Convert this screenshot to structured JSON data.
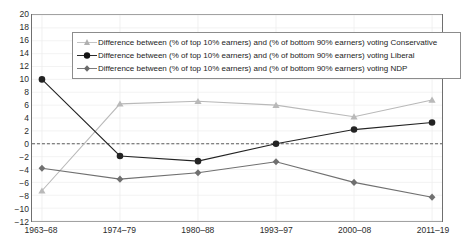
{
  "chart_data": {
    "type": "line",
    "title": "",
    "xlabel": "",
    "ylabel": "",
    "categories": [
      "1963–68",
      "1974–79",
      "1980–88",
      "1993–97",
      "2000–08",
      "2011–19"
    ],
    "ylim": [
      -12,
      20
    ],
    "ytick_step": 2,
    "yticks": [
      20,
      18,
      16,
      14,
      12,
      10,
      8,
      6,
      4,
      2,
      0,
      -2,
      -4,
      -6,
      -8,
      -10,
      -12
    ],
    "ytick_labels": [
      "20",
      "18",
      "16",
      "14",
      "12",
      "10",
      "8",
      "6",
      "4",
      "2",
      "0",
      "−2",
      "−4",
      "−6",
      "−8",
      "−10",
      "−12"
    ],
    "grid": "faint horizontal and vertical gridlines",
    "zero_line": "dashed gray reference line at y = 0",
    "legend_position": "top-inside",
    "series": [
      {
        "name": "Difference between (% of top 10% earners) and (% of bottom 90% earners) voting Conservative",
        "values": [
          -7.3,
          6.2,
          6.6,
          6.0,
          4.2,
          6.8
        ],
        "color": "#b9b9b9",
        "marker": "triangle"
      },
      {
        "name": "Difference between (% of top 10% earners) and (% of bottom 90% earners) voting Liberal",
        "values": [
          10.0,
          -1.9,
          -2.7,
          0.0,
          2.2,
          3.3
        ],
        "color": "#232323",
        "marker": "circle"
      },
      {
        "name": "Difference between (% of top 10% earners) and (% of bottom 90% earners) voting NDP",
        "values": [
          -3.8,
          -5.5,
          -4.5,
          -2.8,
          -6.0,
          -8.3
        ],
        "color": "#707070",
        "marker": "diamond"
      }
    ]
  },
  "legend": {
    "items": [
      {
        "label": "Difference between (% of top 10% earners) and (% of bottom 90% earners) voting Conservative"
      },
      {
        "label": "Difference between (% of top 10% earners) and (% of bottom 90% earners) voting Liberal"
      },
      {
        "label": "Difference between (% of top 10% earners) and (% of bottom 90% earners) voting NDP"
      }
    ]
  }
}
